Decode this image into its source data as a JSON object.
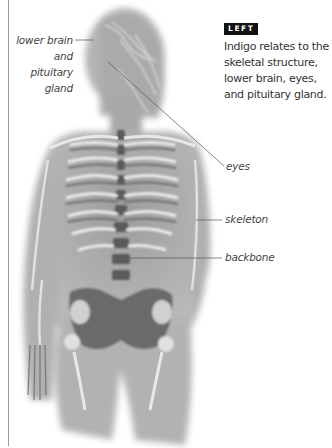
{
  "figure": {
    "labels": {
      "lower_brain_line1": "lower brain",
      "lower_brain_line2": "and",
      "lower_brain_line3": "pituitary",
      "lower_brain_line4": "gland",
      "eyes": "eyes",
      "skeleton": "skeleton",
      "backbone": "backbone"
    }
  },
  "sidebar": {
    "badge": "LEFT",
    "caption": "Indigo relates to the skeletal structure, lower brain, eyes, and pituitary gland."
  },
  "colors": {
    "badge_bg": "#111111",
    "badge_text": "#ffffff",
    "text": "#333333",
    "figure_gray": "#a8a8a8"
  }
}
